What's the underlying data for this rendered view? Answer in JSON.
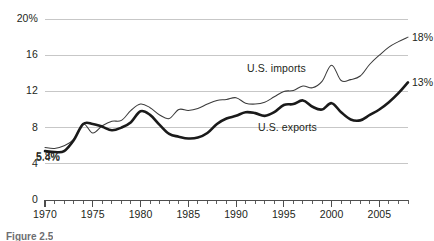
{
  "figure": {
    "caption": "Figure 2.5"
  },
  "chart_data": {
    "type": "line",
    "title": "",
    "subtitle": "",
    "xlabel": "",
    "ylabel": "",
    "xlim": [
      1970,
      2008
    ],
    "ylim": [
      0,
      20
    ],
    "grid": true,
    "grid_axis": "y",
    "legend_position": "inline-annotation",
    "y_ticks": [
      0,
      4,
      8,
      12,
      16,
      20
    ],
    "y_tick_labels": [
      "0",
      "4",
      "8",
      "12",
      "16",
      "20%"
    ],
    "x_ticks": [
      1970,
      1975,
      1980,
      1985,
      1990,
      1995,
      2000,
      2005
    ],
    "x_tick_labels": [
      "1970",
      "1975",
      "1980",
      "1985",
      "1990",
      "1995",
      "2000",
      "2005"
    ],
    "x_minor_tick_interval": 1,
    "annotations": [
      {
        "text": "5.8%",
        "series": "U.S. imports",
        "x": 1970,
        "y": 5.8
      },
      {
        "text": "5.4%",
        "series": "U.S. exports",
        "x": 1970,
        "y": 5.4
      },
      {
        "text": "18%",
        "series": "U.S. imports",
        "x": 2008,
        "y": 18
      },
      {
        "text": "13%",
        "series": "U.S. exports",
        "x": 2008,
        "y": 13
      }
    ],
    "series": [
      {
        "name": "U.S. imports",
        "style": "thin",
        "color": "#3b3b3b",
        "end_label": "18%",
        "start_label": "5.8%",
        "x": [
          1970,
          1971,
          1972,
          1973,
          1974,
          1975,
          1976,
          1977,
          1978,
          1979,
          1980,
          1981,
          1982,
          1983,
          1984,
          1985,
          1986,
          1987,
          1988,
          1989,
          1990,
          1991,
          1992,
          1993,
          1994,
          1995,
          1996,
          1997,
          1998,
          1999,
          2000,
          2001,
          2002,
          2003,
          2004,
          2005,
          2006,
          2007,
          2008
        ],
        "values": [
          5.8,
          5.7,
          6.0,
          6.7,
          8.4,
          7.4,
          8.2,
          8.7,
          8.8,
          9.9,
          10.6,
          10.2,
          9.4,
          9.0,
          10.0,
          9.9,
          10.1,
          10.6,
          11.0,
          11.1,
          11.3,
          10.7,
          10.6,
          10.8,
          11.4,
          12.0,
          12.1,
          12.6,
          12.4,
          13.1,
          14.9,
          13.2,
          13.3,
          13.7,
          15.0,
          16.0,
          16.9,
          17.5,
          18.0
        ]
      },
      {
        "name": "U.S. exports",
        "style": "thick",
        "color": "#1a1a1a",
        "end_label": "13%",
        "start_label": "5.4%",
        "x": [
          1970,
          1971,
          1972,
          1973,
          1974,
          1975,
          1976,
          1977,
          1978,
          1979,
          1980,
          1981,
          1982,
          1983,
          1984,
          1985,
          1986,
          1987,
          1988,
          1989,
          1990,
          1991,
          1992,
          1993,
          1994,
          1995,
          1996,
          1997,
          1998,
          1999,
          2000,
          2001,
          2002,
          2003,
          2004,
          2005,
          2006,
          2007,
          2008
        ],
        "values": [
          5.4,
          5.3,
          5.4,
          6.6,
          8.4,
          8.4,
          8.1,
          7.7,
          8.0,
          8.6,
          9.8,
          9.4,
          8.3,
          7.3,
          7.0,
          6.8,
          6.9,
          7.4,
          8.4,
          9.0,
          9.3,
          9.7,
          9.6,
          9.3,
          9.7,
          10.5,
          10.6,
          11.0,
          10.3,
          10.0,
          10.7,
          9.7,
          8.9,
          8.8,
          9.4,
          10.0,
          10.8,
          11.8,
          13.0
        ]
      }
    ]
  },
  "plot_geometry": {
    "left": 45,
    "right": 408,
    "top": 19,
    "bottom": 200
  }
}
